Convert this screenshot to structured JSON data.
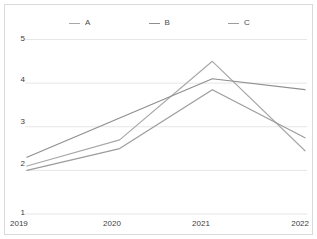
{
  "chart_data": {
    "type": "line",
    "title": "",
    "subtitle": "",
    "xlabel": "",
    "ylabel": "",
    "categories": [
      "2019",
      "2020",
      "2021",
      "2022"
    ],
    "x": [
      2019,
      2020,
      2021,
      2022
    ],
    "series": [
      {
        "name": "A",
        "color": "#a8a8a8",
        "values": [
          2.1,
          2.7,
          4.5,
          2.45
        ]
      },
      {
        "name": "B",
        "color": "#8f8f8f",
        "values": [
          2.3,
          3.2,
          4.1,
          3.85
        ]
      },
      {
        "name": "C",
        "color": "#9c9c9c",
        "values": [
          2.0,
          2.5,
          3.85,
          2.75
        ]
      }
    ],
    "ylim": [
      1,
      5
    ],
    "yticks": [
      1,
      2,
      3,
      4,
      5
    ],
    "ytick_labels": [
      "1",
      "2",
      "3",
      "4",
      "5"
    ],
    "xtick_labels": [
      "2019",
      "2020",
      "2021",
      "2022"
    ],
    "grid": true,
    "grid_axis": "y",
    "grid_color": "#e6e6e6",
    "legend": {
      "position": "top",
      "entries": [
        "A",
        "B",
        "C"
      ]
    },
    "background": "#ffffff",
    "border_color": "#d9d9d9"
  },
  "legend": {
    "items": [
      {
        "label": "A"
      },
      {
        "label": "B"
      },
      {
        "label": "C"
      }
    ]
  },
  "axes": {
    "y_labels": [
      "5",
      "4",
      "3",
      "2",
      "1"
    ],
    "x_labels": [
      "2019",
      "2020",
      "2021",
      "2022"
    ]
  }
}
